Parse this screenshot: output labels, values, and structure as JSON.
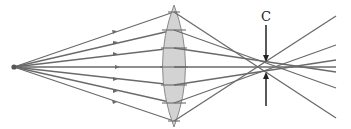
{
  "diagram": {
    "label_circle_of_least_confusion": "C",
    "colors": {
      "ray": "#6a6a6a",
      "lens_fill": "#d3d3d3",
      "lens_stroke": "#8a8a8a",
      "marker": "#222222",
      "source": "#555555"
    },
    "source": {
      "x": 14,
      "y": 67
    },
    "lens": {
      "cx": 174,
      "top": 5,
      "bottom": 127,
      "half_width": 12
    },
    "rays": [
      {
        "lens_y": 12,
        "end_x": 336,
        "end_y": 118
      },
      {
        "lens_y": 30,
        "end_x": 336,
        "end_y": 88
      },
      {
        "lens_y": 48,
        "end_x": 336,
        "end_y": 72
      },
      {
        "lens_y": 67,
        "end_x": 336,
        "end_y": 67
      },
      {
        "lens_y": 85,
        "end_x": 336,
        "end_y": 60
      },
      {
        "lens_y": 103,
        "end_x": 336,
        "end_y": 45
      },
      {
        "lens_y": 121,
        "end_x": 336,
        "end_y": 16
      }
    ]
  }
}
